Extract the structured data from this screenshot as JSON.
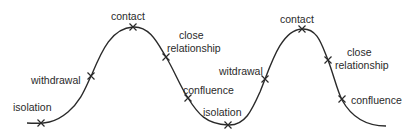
{
  "diagram": {
    "type": "contact-cycle-wave",
    "curve_color": "#2a2a2a",
    "labels": [
      {
        "id": "isolation-1",
        "text": "isolation",
        "x": 13,
        "y": 102
      },
      {
        "id": "withdrawal-1",
        "text": "withdrawal",
        "x": 31,
        "y": 75
      },
      {
        "id": "contact-1",
        "text": "contact",
        "x": 111,
        "y": 11
      },
      {
        "id": "close-1",
        "text": "close",
        "x": 179,
        "y": 30
      },
      {
        "id": "relationship-1",
        "text": "relationship",
        "x": 167,
        "y": 43
      },
      {
        "id": "confluence-1",
        "text": "confluence",
        "x": 183,
        "y": 85
      },
      {
        "id": "isolation-2",
        "text": "isolation",
        "x": 203,
        "y": 107
      },
      {
        "id": "withdrawal-2",
        "text": "witdrawal",
        "x": 219,
        "y": 66
      },
      {
        "id": "contact-2",
        "text": "contact",
        "x": 280,
        "y": 14
      },
      {
        "id": "close-2",
        "text": "close",
        "x": 347,
        "y": 47
      },
      {
        "id": "relationship-2",
        "text": "relationship",
        "x": 335,
        "y": 60
      },
      {
        "id": "confluence-2",
        "text": "confluence",
        "x": 351,
        "y": 95
      }
    ],
    "markers": [
      {
        "stage": "isolation",
        "x": 41,
        "y": 123
      },
      {
        "stage": "withdrawal",
        "x": 91,
        "y": 76
      },
      {
        "stage": "contact",
        "x": 133,
        "y": 27
      },
      {
        "stage": "close relationship",
        "x": 166,
        "y": 57
      },
      {
        "stage": "confluence",
        "x": 188,
        "y": 98
      },
      {
        "stage": "isolation",
        "x": 228,
        "y": 125
      },
      {
        "stage": "withdrawal",
        "x": 265,
        "y": 79
      },
      {
        "stage": "contact",
        "x": 302,
        "y": 29
      },
      {
        "stage": "close relationship",
        "x": 328,
        "y": 60
      },
      {
        "stage": "confluence",
        "x": 342,
        "y": 99
      }
    ]
  }
}
